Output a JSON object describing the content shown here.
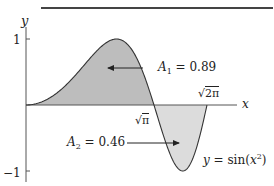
{
  "chart_data": {
    "type": "area",
    "title": "",
    "function": "y = sin(x^2)",
    "xlabel": "x",
    "ylabel": "y",
    "xlim": [
      0,
      2.75
    ],
    "ylim": [
      -1,
      1
    ],
    "yticks": [
      {
        "value": 1,
        "label": "1"
      },
      {
        "value": -1,
        "label": "-1"
      }
    ],
    "xticks": [
      {
        "value": 1.7725,
        "label": "√π"
      },
      {
        "value": 2.5066,
        "label": "√2π"
      }
    ],
    "regions": [
      {
        "name": "A1",
        "from": 0,
        "to": 1.7725,
        "area": 0.89,
        "sign": "positive",
        "fill": "#bdbdbd"
      },
      {
        "name": "A2",
        "from": 1.7725,
        "to": 2.5066,
        "area": 0.46,
        "sign": "negative",
        "fill": "#dcdcdc"
      }
    ],
    "annotations": [
      {
        "text": "A₁ = 0.89",
        "points_to": "A1"
      },
      {
        "text": "A₂ = 0.46",
        "points_to": "A2"
      },
      {
        "text": "y = sin(x²)",
        "points_to": "curve"
      }
    ],
    "grid": false,
    "legend": "none"
  },
  "labels": {
    "y_axis": "y",
    "x_axis": "x",
    "y_tick_pos": "1",
    "y_tick_neg": "−1",
    "a1_name": "A",
    "a1_sub": "1",
    "a1_value": " = 0.89",
    "a2_name": "A",
    "a2_sub": "2",
    "a2_value": " = 0.46",
    "sqrt_pi": "π",
    "sqrt_2pi": "2π",
    "curve_y": "y",
    "curve_eq": " = sin(",
    "curve_x": "x",
    "curve_exp": "2",
    "curve_close": ")"
  },
  "layout": {
    "origin_px": [
      26,
      105
    ],
    "x_scale": 72.2,
    "y_scale": 66,
    "x_axis_end_px": 237,
    "colors": {
      "axis": "#555555",
      "curve": "#333333",
      "fill_pos": "#bdbdbd",
      "fill_neg": "#dcdcdc",
      "text": "#222222"
    }
  }
}
